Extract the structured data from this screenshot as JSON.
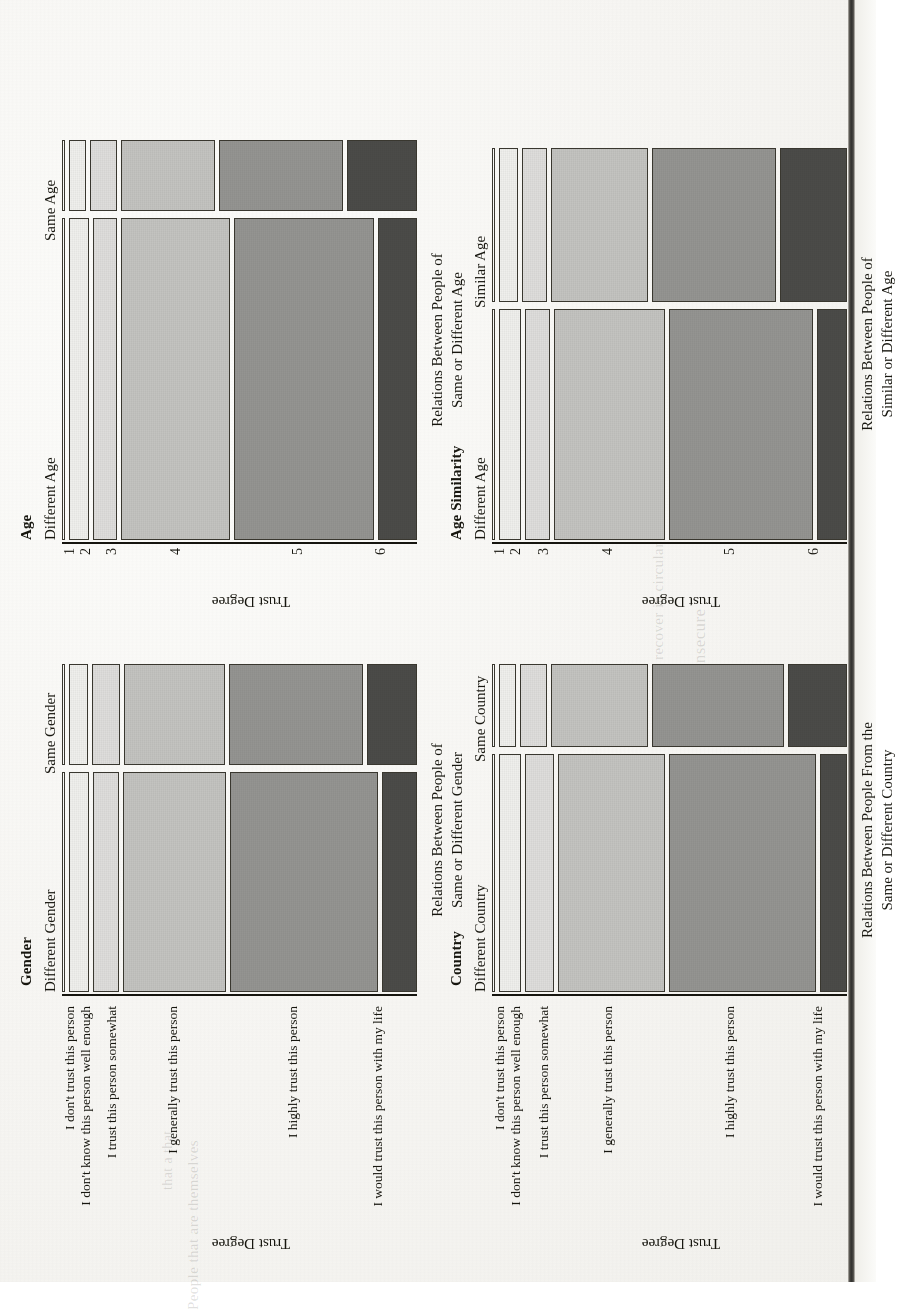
{
  "figure": {
    "trust_axis_label": "Trust Degree",
    "tick_numbers": [
      "1",
      "2",
      "3",
      "4",
      "5",
      "6"
    ],
    "trust_level_labels": [
      "I don't trust this person",
      "I don't know this person well enough",
      "I trust this person somewhat",
      "I generally trust this person",
      "I highly trust this person",
      "I would trust this person with my life"
    ],
    "fill_colors": [
      "#fbfbf9",
      "#efefec",
      "#dedddb",
      "#c3c3c0",
      "#949491",
      "#4b4b48"
    ]
  },
  "panels": [
    {
      "id": "gender",
      "title": "Gender",
      "columns": [
        "Different Gender",
        "Same Gender"
      ],
      "xlabel_lines": [
        "Relations Between People of",
        "Same or Different Gender"
      ],
      "ylabel": "Trust Degree",
      "tick_style": "text"
    },
    {
      "id": "age",
      "title": "Age",
      "columns": [
        "Different Age",
        "Same Age"
      ],
      "xlabel_lines": [
        "Relations Between People of",
        "Same or Different Age"
      ],
      "ylabel": "Trust Degree",
      "tick_style": "number"
    },
    {
      "id": "country",
      "title": "Country",
      "columns": [
        "Different Country",
        "Same Country"
      ],
      "xlabel_lines": [
        "Relations Between People From the",
        "Same or Different Country"
      ],
      "ylabel": "Trust Degree",
      "tick_style": "text"
    },
    {
      "id": "age-similarity",
      "title": "Age Similarity",
      "columns": [
        "Different Age",
        "Similar Age"
      ],
      "xlabel_lines": [
        "Relations Between People of",
        "Similar or Different Age"
      ],
      "ylabel": "Trust Degree",
      "tick_style": "number"
    }
  ],
  "ghost_text": [
    "integers insecure",
    "recover in circular",
    "People that are themselves",
    "that a that"
  ],
  "chart_data": [
    {
      "type": "mosaic",
      "id": "gender",
      "title": "Gender",
      "xlabel": "Relations Between People of Same or Different Gender",
      "ylabel": "Trust Degree",
      "columns": [
        "Different Gender",
        "Same Gender"
      ],
      "column_widths_pct": [
        68.5,
        31.5
      ],
      "categories": [
        "I don't trust this person",
        "I don't know this person well enough",
        "I trust this person somewhat",
        "I generally trust this person",
        "I highly trust this person",
        "I would trust this person with my life"
      ],
      "series": [
        {
          "name": "Different Gender",
          "values": [
            1.0,
            6.0,
            7.5,
            31.0,
            44.0,
            10.5
          ]
        },
        {
          "name": "Same Gender",
          "values": [
            1.0,
            5.5,
            8.5,
            30.0,
            40.0,
            15.0
          ]
        }
      ]
    },
    {
      "type": "mosaic",
      "id": "age",
      "title": "Age",
      "xlabel": "Relations Between People of Same or Different Age",
      "ylabel": "Trust Degree",
      "columns": [
        "Different Age",
        "Same Age"
      ],
      "column_widths_pct": [
        82.0,
        18.0
      ],
      "categories": [
        "1",
        "2",
        "3",
        "4",
        "5",
        "6"
      ],
      "series": [
        {
          "name": "Different Age",
          "values": [
            1.0,
            6.0,
            7.0,
            32.5,
            42.0,
            11.5
          ]
        },
        {
          "name": "Same Age",
          "values": [
            1.0,
            5.0,
            8.0,
            28.0,
            37.0,
            21.0
          ]
        }
      ]
    },
    {
      "type": "mosaic",
      "id": "country",
      "title": "Country",
      "xlabel": "Relations Between People From the Same or Different Country",
      "ylabel": "Trust Degree",
      "columns": [
        "Different Country",
        "Same Country"
      ],
      "column_widths_pct": [
        74.0,
        26.0
      ],
      "categories": [
        "I don't trust this person",
        "I don't know this person well enough",
        "I trust this person somewhat",
        "I generally trust this person",
        "I highly trust this person",
        "I would trust this person with my life"
      ],
      "series": [
        {
          "name": "Different Country",
          "values": [
            1.0,
            6.5,
            8.5,
            32.0,
            44.0,
            8.0
          ]
        },
        {
          "name": "Same Country",
          "values": [
            1.0,
            5.0,
            8.0,
            29.0,
            39.5,
            17.5
          ]
        }
      ]
    },
    {
      "type": "mosaic",
      "id": "age-similarity",
      "title": "Age Similarity",
      "xlabel": "Relations Between People of Similar or Different Age",
      "ylabel": "Trust Degree",
      "columns": [
        "Different Age",
        "Similar Age"
      ],
      "column_widths_pct": [
        60.0,
        40.0
      ],
      "categories": [
        "1",
        "2",
        "3",
        "4",
        "5",
        "6"
      ],
      "series": [
        {
          "name": "Different Age",
          "values": [
            1.0,
            6.5,
            7.5,
            33.0,
            43.0,
            9.0
          ]
        },
        {
          "name": "Similar Age",
          "values": [
            1.0,
            5.5,
            7.5,
            29.0,
            37.0,
            20.0
          ]
        }
      ]
    }
  ]
}
